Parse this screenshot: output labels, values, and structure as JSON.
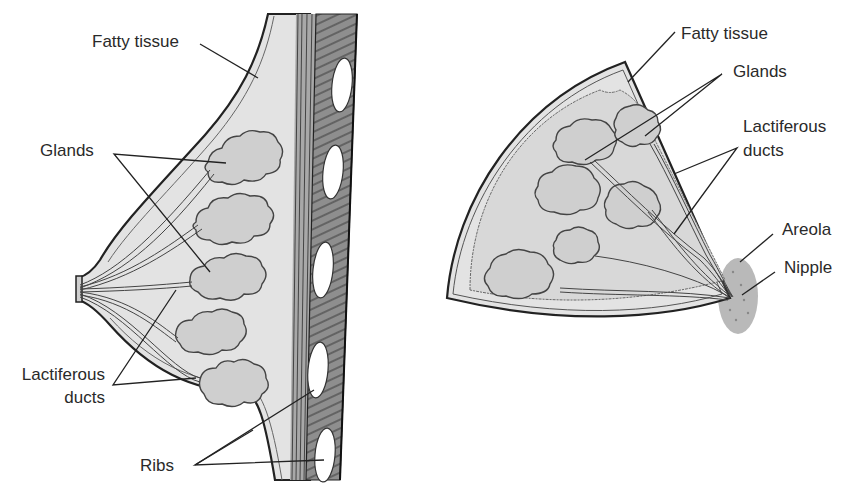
{
  "colors": {
    "tissue": "#e3e3e3",
    "gland": "#cfcfcf",
    "wall": "#9a9a9a",
    "rib": "#ffffff",
    "outline": "#222222",
    "areola": "#b9b9b9"
  },
  "side_view": {
    "labels": {
      "fatty_tissue": "Fatty tissue",
      "glands": "Glands",
      "lactiferous_ducts_line1": "Lactiferous",
      "lactiferous_ducts_line2": "ducts",
      "ribs": "Ribs"
    }
  },
  "front_view": {
    "labels": {
      "fatty_tissue": "Fatty tissue",
      "glands": "Glands",
      "lactiferous_ducts_line1": "Lactiferous",
      "lactiferous_ducts_line2": "ducts",
      "areola": "Areola",
      "nipple": "Nipple"
    }
  }
}
